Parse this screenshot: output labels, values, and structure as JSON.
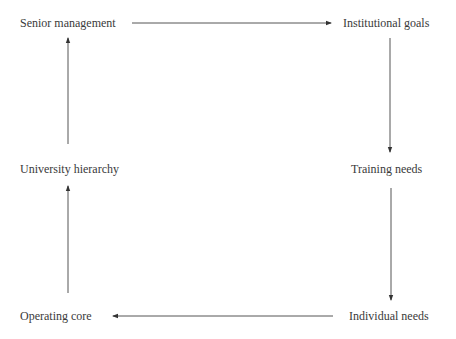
{
  "diagram": {
    "nodes": [
      {
        "id": "senior",
        "label": "Senior management"
      },
      {
        "id": "inst",
        "label": "Institutional goals"
      },
      {
        "id": "univ",
        "label": "University hierarchy"
      },
      {
        "id": "training",
        "label": "Training needs"
      },
      {
        "id": "operating",
        "label": "Operating core"
      },
      {
        "id": "individual",
        "label": "Individual needs"
      }
    ],
    "edges": [
      {
        "from": "senior",
        "to": "inst"
      },
      {
        "from": "inst",
        "to": "training"
      },
      {
        "from": "training",
        "to": "individual"
      },
      {
        "from": "individual",
        "to": "operating"
      },
      {
        "from": "operating",
        "to": "univ"
      },
      {
        "from": "univ",
        "to": "senior"
      }
    ],
    "colors": {
      "text": "#3a3a3a",
      "line": "#555555"
    }
  }
}
